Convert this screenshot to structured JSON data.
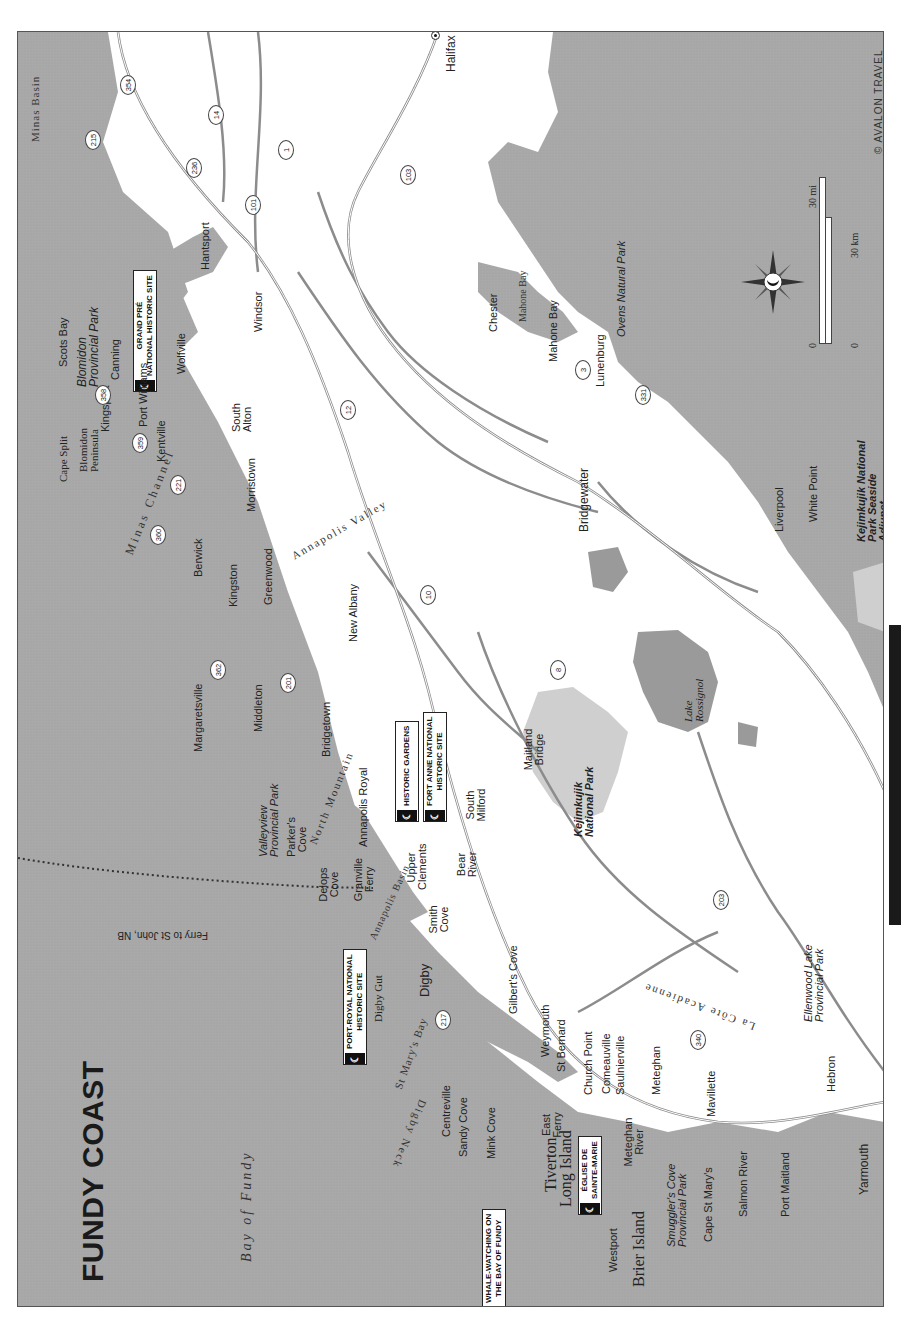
{
  "map": {
    "title": "FUNDY COAST",
    "copyright": "© AVALON TRAVEL",
    "orientation": "rotated 90° counter-clockwise (north points right)",
    "colors": {
      "water": "#a9a9a9",
      "land": "#ffffff",
      "park": "#cfcfcf",
      "lake": "#9a9a9a",
      "road": "#8c8c8c",
      "callout_border": "#222222",
      "page_tab": "#1a1a1a"
    },
    "scale": {
      "mi_zero": "0",
      "mi_label": "30 mi",
      "km_zero": "0",
      "km_label": "30 km"
    },
    "compass": "compass-rose",
    "water_bodies": [
      {
        "name": "Bay of Fundy"
      },
      {
        "name": "Minas Channel"
      },
      {
        "name": "Minas Basin"
      },
      {
        "name": "St Mary's Bay"
      },
      {
        "name": "Annapolis Basin"
      },
      {
        "name": "Mahone Bay"
      },
      {
        "name": "Digby Gut"
      }
    ],
    "regions": [
      {
        "name": "Annapolis Valley"
      },
      {
        "name": "La Côte Acadienne"
      },
      {
        "name": "North Mountain"
      },
      {
        "name": "Digby Neck"
      },
      {
        "name": "Cape Split"
      },
      {
        "name": "Blomidon Peninsula"
      }
    ],
    "lakes": [
      {
        "name": "Lake Rossignol"
      }
    ],
    "parks": [
      {
        "name": "Blomidon Provincial Park"
      },
      {
        "name": "Valleyview Provincial Park"
      },
      {
        "name": "Kejimkujik National Park"
      },
      {
        "name": "Kejimkujik National Park Seaside Adjunct"
      },
      {
        "name": "Ovens Natural Park"
      },
      {
        "name": "Smuggler's Cove Provincial Park"
      },
      {
        "name": "Ellenwood Lake Provincial Park"
      }
    ],
    "callouts": [
      {
        "line1": "GRAND PRÉ",
        "line2": "NATIONAL HISTORIC SITE"
      },
      {
        "line1": "HISTORIC GARDENS",
        "line2": ""
      },
      {
        "line1": "FORT ANNE NATIONAL",
        "line2": "HISTORIC SITE"
      },
      {
        "line1": "PORT-ROYAL NATIONAL",
        "line2": "HISTORIC SITE"
      },
      {
        "line1": "ÉGLISE DE",
        "line2": "SAINTE-MARIE"
      },
      {
        "line1": "WHALE-WATCHING ON",
        "line2": "THE BAY OF FUNDY"
      }
    ],
    "ferry": {
      "label": "Ferry to St John, NB"
    },
    "capital": {
      "name": "Halifax"
    },
    "towns": [
      "Scots Bay",
      "Canning",
      "Kingsport",
      "Port Williams",
      "Wolfville",
      "Kentville",
      "Hantsport",
      "Windsor",
      "South Alton",
      "Berwick",
      "Morristown",
      "Kingston",
      "Greenwood",
      "Margaretsville",
      "Middleton",
      "New Albany",
      "Bridgetown",
      "Annapolis Royal",
      "Parker's Cove",
      "Delops Cove",
      "Granville Ferry",
      "Upper Clements",
      "Smith Cove",
      "Bear River",
      "South Milford",
      "Maitland Bridge",
      "Digby",
      "Gilbert's Cove",
      "Weymouth",
      "St Bernard",
      "Church Point",
      "Comeauville",
      "Saulnierville",
      "Meteghan",
      "Meteghan River",
      "Mavillette",
      "Cape St Mary's",
      "Salmon River",
      "Port Maitland",
      "Yarmouth",
      "Hebron",
      "Centreville",
      "Sandy Cove",
      "Mink Cove",
      "East Ferry",
      "Tiverton",
      "Long Island",
      "Westport",
      "Brier Island",
      "Chester",
      "Mahone Bay",
      "Lunenburg",
      "Bridgewater",
      "Liverpool",
      "White Point"
    ],
    "routes": [
      "354",
      "215",
      "14",
      "236",
      "1",
      "101",
      "103",
      "12",
      "3",
      "331",
      "359",
      "358",
      "221",
      "360",
      "362",
      "201",
      "10",
      "8",
      "203",
      "217",
      "340"
    ]
  }
}
